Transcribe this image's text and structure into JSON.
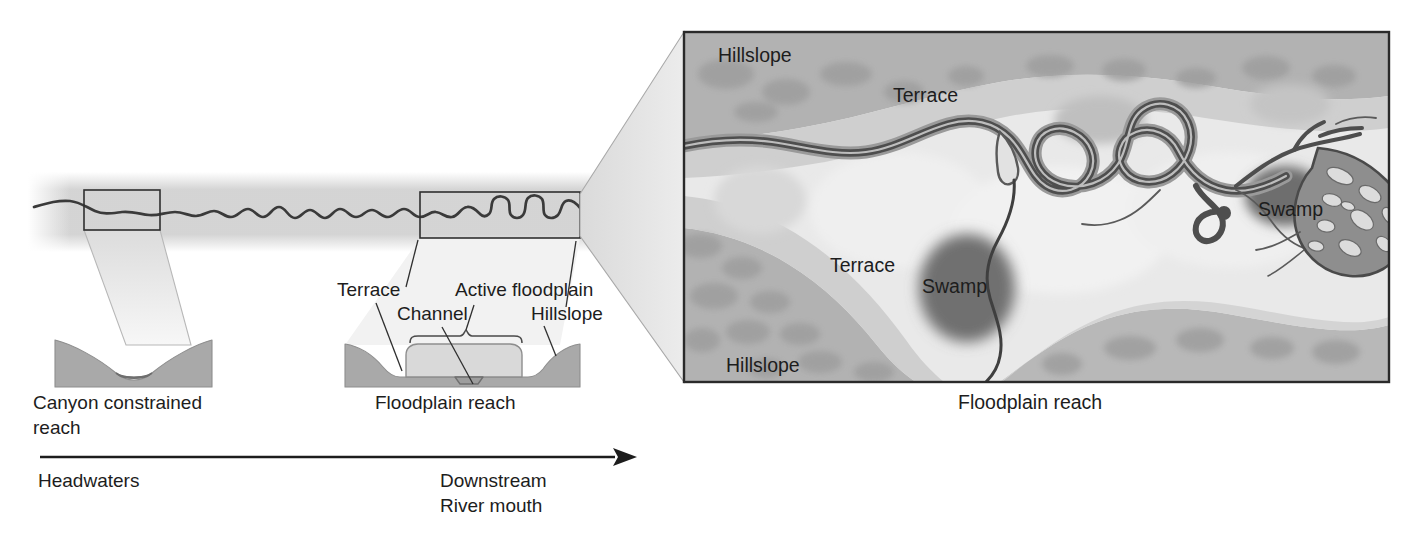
{
  "figure": {
    "background_color": "#ffffff",
    "width": 1427,
    "height": 535
  },
  "palette": {
    "ink": "#1d1d1d",
    "line": "#3a3a3a",
    "haze_band": "#d2d2d2",
    "valley_fill": "#a9a9a9",
    "valley_stroke": "#8a8a8a",
    "floodplain_fill": "#d6d6d6",
    "channel_fill": "#b4b4b4",
    "zoom_cone": "#e2e2e2",
    "panel_hillslope": "#b0b0b0",
    "panel_hillslope_mottle": "#9d9d9d",
    "panel_terrace": "#cdcdcd",
    "panel_floodplain": "#e6e6e6",
    "panel_border": "#2a2a2a",
    "river_dark": "#4a4a4a",
    "river_halo": "#8c8c8c",
    "swamp": "#6f6f6f"
  },
  "longitudinal_profile": {
    "name": "river-long-profile",
    "description": "Planform river line running left (headwaters) to right (river mouth), sinuosity increases downstream",
    "haze_band_label": "valley corridor haze"
  },
  "zoom_boxes": {
    "canyon_box": {
      "name": "canyon-zoom-box"
    },
    "floodplain_box": {
      "name": "floodplain-zoom-box"
    }
  },
  "cross_sections": [
    {
      "id": "canyon",
      "caption_lines": [
        "Canyon constrained",
        "reach"
      ],
      "caption": "Canyon constrained reach",
      "labels": []
    },
    {
      "id": "floodplain",
      "caption_lines": [
        "Floodplain reach"
      ],
      "caption": "Floodplain reach",
      "labels": [
        {
          "key": "terrace",
          "text": "Terrace"
        },
        {
          "key": "channel",
          "text": "Channel"
        },
        {
          "key": "active_floodplain",
          "text": "Active floodplain"
        },
        {
          "key": "hillslope",
          "text": "Hillslope"
        }
      ]
    }
  ],
  "detail_panel": {
    "caption": "Floodplain reach",
    "labels": [
      {
        "key": "hillslope_top",
        "text": "Hillslope"
      },
      {
        "key": "terrace_top",
        "text": "Terrace"
      },
      {
        "key": "terrace_lower",
        "text": "Terrace"
      },
      {
        "key": "hillslope_bottom",
        "text": "Hillslope"
      },
      {
        "key": "swamp_lower",
        "text": "Swamp"
      },
      {
        "key": "swamp_upper",
        "text": "Swamp"
      }
    ],
    "features": [
      "meandering main channel",
      "oxbow / cutoff loops",
      "tributary network",
      "anastomosing braided reach",
      "swamp wetlands"
    ]
  },
  "axis": {
    "name": "downstream-axis",
    "start_label": "Headwaters",
    "end_label_lines": [
      "Downstream",
      "River mouth"
    ],
    "end_label": "Downstream River mouth",
    "direction": "left-to-right"
  }
}
